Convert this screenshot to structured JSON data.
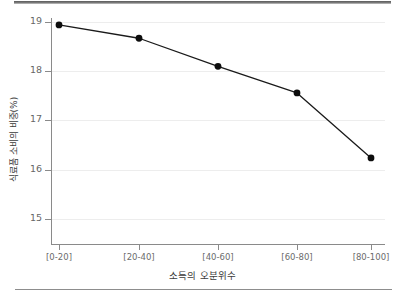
{
  "chart_data": {
    "type": "line",
    "title": "",
    "subtitle": "",
    "xlabel": "소득의 오분위수",
    "ylabel": "식료품 소비의 비중(%)",
    "categories": [
      "[0-20]",
      "[20-40]",
      "[40-60]",
      "[60-80]",
      "[80-100]"
    ],
    "values": [
      18.94,
      18.67,
      18.1,
      17.56,
      16.24
    ],
    "series": [
      {
        "name": "식료품 소비의 비중(%)",
        "values": [
          18.94,
          18.67,
          18.1,
          17.56,
          16.24
        ]
      }
    ],
    "ylim": [
      15,
      19
    ],
    "yticks": [
      15,
      16,
      17,
      18,
      19
    ],
    "ytick_labels": [
      "15",
      "16",
      "17",
      "18",
      "19"
    ],
    "xtick_labels": [
      "[0-20]",
      "[20-40]",
      "[40-60]",
      "[60-80]",
      "[80-100]"
    ],
    "grid": true,
    "grid_axis": "y",
    "legend": false,
    "legend_position": "none",
    "marker": "circle",
    "line_color": "#1a1a1a",
    "marker_color": "#0d0d0d",
    "grid_color": "#ededed",
    "axis_color": "#8a8a8a",
    "background_color": "#ffffff",
    "annotations": []
  },
  "figure": {
    "top_rule_color": "#5a5a5a",
    "bottom_rule_color": "#8d8d8d"
  }
}
